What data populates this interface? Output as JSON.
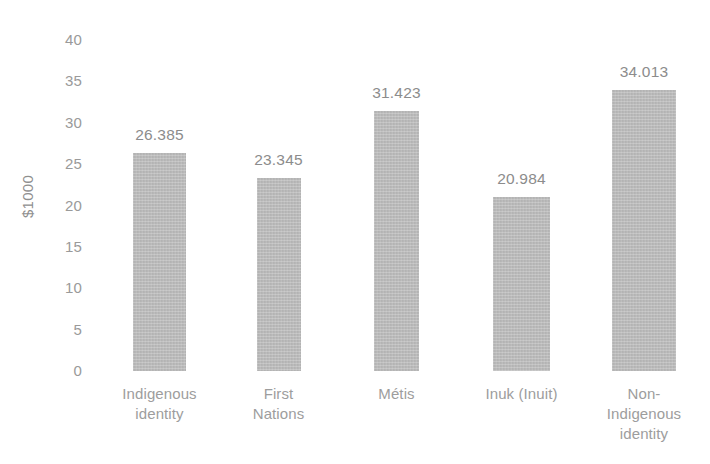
{
  "chart_data": {
    "type": "bar",
    "title": "",
    "subtitle": "",
    "xlabel": "",
    "ylabel": "$1000",
    "ylim": [
      0,
      40
    ],
    "yticks": [
      "0",
      "5",
      "10",
      "15",
      "20",
      "25",
      "30",
      "35",
      "40"
    ],
    "grid": false,
    "legend": false,
    "legend_position": "none",
    "bar_color": "#b9b9b9",
    "text_color": "#949494",
    "background_color": "#ffffff",
    "categories": [
      "Indigenous\nidentity",
      "First\nNations",
      "Métis",
      "Inuk (Inuit)",
      "Non-\nIndigenous\nidentity"
    ],
    "values": [
      26.385,
      23.345,
      31.423,
      20.984,
      34.013
    ],
    "value_labels": [
      "26.385",
      "23.345",
      "31.423",
      "20.984",
      "34.013"
    ]
  }
}
